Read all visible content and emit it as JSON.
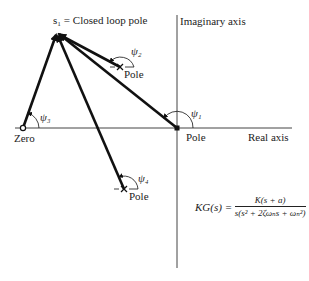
{
  "diagram": {
    "type": "root-locus angle construction",
    "labels": {
      "s1": "s₁ = Closed loop pole",
      "imag_axis": "Imaginary axis",
      "real_axis": "Real axis",
      "zero": "Zero",
      "pole_origin": "Pole",
      "pole_upper": "Pole",
      "pole_lower": "Pole",
      "psi1": "ψ₁",
      "psi2": "ψ₂",
      "psi3": "ψ₃",
      "psi4": "ψ₄"
    },
    "equation": {
      "lhs": "KG(s) =",
      "numerator": "K(s + a)",
      "denominator": "s(s² + 2ζωₙs + ωₙ²)"
    },
    "points": {
      "s1": [
        57,
        32
      ],
      "origin_pole": [
        177,
        128
      ],
      "zero": [
        23,
        128
      ],
      "upper_pole": [
        120,
        67
      ],
      "lower_pole": [
        124,
        189
      ]
    },
    "colors": {
      "line": "#111111",
      "axis": "#444444"
    }
  }
}
